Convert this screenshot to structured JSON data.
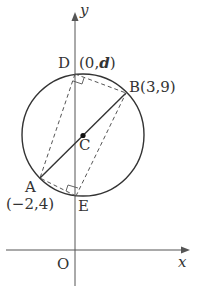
{
  "figure": {
    "type": "coordinate-geometry",
    "axes": {
      "x_label": "x",
      "y_label": "y",
      "origin_label": "O"
    },
    "points": {
      "A": {
        "label": "A",
        "coord": "(−2,4)"
      },
      "B": {
        "label": "B",
        "coord": "(3,9)"
      },
      "C": {
        "label": "C"
      },
      "D": {
        "label": "D",
        "coord_pre": "(0,",
        "coord_var": "d",
        "coord_post": ")"
      },
      "E": {
        "label": "E"
      }
    },
    "colors": {
      "ink": "#333333",
      "background": "#ffffff"
    }
  }
}
